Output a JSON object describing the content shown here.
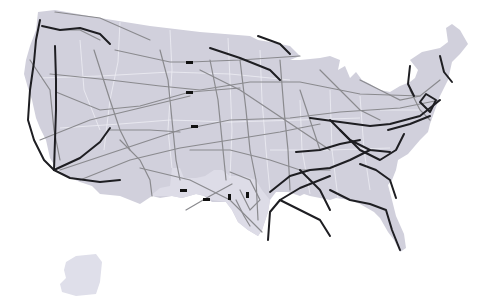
{
  "map": {
    "subject": "Contiguous United States network map",
    "colors": {
      "background": "#ffffff",
      "land": "#d1d0dc",
      "land_alt": "#c8c7d4",
      "texas_land": "#e2e1ea",
      "state_border": "#eeeef4",
      "minor_line": "#8a8a8e",
      "major_line": "#1e1e22",
      "marker": "#111111"
    },
    "legend": null,
    "labels": []
  }
}
